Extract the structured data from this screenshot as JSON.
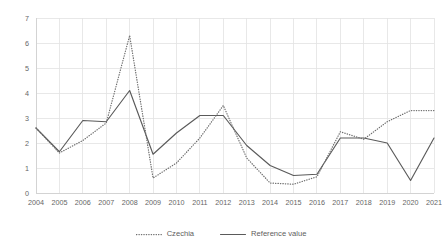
{
  "chart_data": {
    "type": "line",
    "title": "",
    "subtitle": "",
    "xlabel": "",
    "ylabel": "",
    "categories": [
      "2004",
      "2005",
      "2006",
      "2007",
      "2008",
      "2009",
      "2010",
      "2011",
      "2012",
      "2013",
      "2014",
      "2015",
      "2016",
      "2017",
      "2018",
      "2019",
      "2020",
      "2021"
    ],
    "series": [
      {
        "name": "Czechia",
        "style": "dotted",
        "color": "#6e6e6e",
        "values": [
          2.6,
          1.6,
          2.1,
          2.8,
          6.3,
          0.6,
          1.2,
          2.2,
          3.5,
          1.4,
          0.4,
          0.35,
          0.65,
          2.45,
          2.15,
          2.85,
          3.3,
          3.3
        ]
      },
      {
        "name": "Reference value",
        "style": "solid",
        "color": "#5a5a5a",
        "values": [
          2.6,
          1.65,
          2.9,
          2.85,
          4.1,
          1.55,
          2.4,
          3.1,
          3.1,
          1.9,
          1.1,
          0.7,
          0.75,
          2.2,
          2.2,
          2.0,
          0.5,
          2.2
        ]
      }
    ],
    "ylim": [
      0,
      7
    ],
    "yticks": [
      "0",
      "1",
      "2",
      "3",
      "4",
      "5",
      "6",
      "7"
    ],
    "xlim_categories": [
      "2004",
      "2021"
    ],
    "grid": true,
    "grid_color": "#e2e2e2",
    "legend_position": "bottom",
    "background": "#ffffff"
  },
  "legend": {
    "entries": [
      {
        "label": "Czechia",
        "style": "dotted"
      },
      {
        "label": "Reference value",
        "style": "solid"
      }
    ]
  }
}
